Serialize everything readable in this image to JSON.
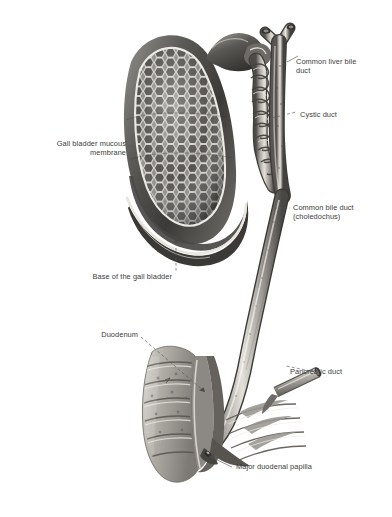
{
  "figure": {
    "background_color": "#ffffff",
    "ink_color": "#3b3b3b",
    "style": "anatomical engraving, grayscale halftone"
  },
  "labels": {
    "common_liver_bile_duct": "Common liver bile\nduct",
    "cystic_duct": "Cystic duct",
    "common_bile_duct": "Common bile duct\n(choledochus)",
    "gall_bladder_mucous_membrane": "Gall bladder mucous\nmembrane",
    "base_of_gall_bladder": "Base of the gall bladder",
    "duodenum": "Duodenum",
    "pancreatic_duct": "Pancreatic duct",
    "major_duodenal_papilla": "Major duodenal papilla"
  },
  "structures": [
    {
      "name": "gall-bladder",
      "region": "upper-left",
      "detail": "opened, showing honeycomb mucosa"
    },
    {
      "name": "cystic-duct",
      "region": "upper-middle",
      "detail": "spiral valves of Heister"
    },
    {
      "name": "common-hepatic-duct",
      "region": "upper-right",
      "detail": "bifurcated at top"
    },
    {
      "name": "common-bile-duct",
      "region": "middle",
      "detail": "long descending duct"
    },
    {
      "name": "duodenum",
      "region": "lower-left",
      "detail": "opened, circular folds"
    },
    {
      "name": "pancreatic-duct",
      "region": "lower-right",
      "detail": "cut stump"
    },
    {
      "name": "major-duodenal-papilla",
      "region": "lower-middle",
      "detail": "ampulla opening"
    }
  ]
}
